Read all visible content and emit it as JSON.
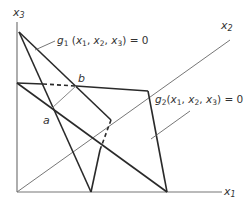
{
  "diagram": {
    "type": "3d-constraint-surfaces",
    "axes": {
      "x1": {
        "label_base": "x",
        "label_sub": "1"
      },
      "x2": {
        "label_base": "x",
        "label_sub": "2"
      },
      "x3": {
        "label_base": "x",
        "label_sub": "3"
      }
    },
    "points": {
      "a": {
        "label": "a"
      },
      "b": {
        "label": "b"
      }
    },
    "surfaces": [
      {
        "name": "g1",
        "label_fn": "g",
        "label_sub": "1",
        "label_args": "(x",
        "eq": "= 0"
      },
      {
        "name": "g2",
        "label_fn": "g",
        "label_sub": "2",
        "label_args": "(x",
        "eq": "= 0"
      }
    ],
    "colors": {
      "heavy_line": "#2a2a2a",
      "axis_line": "#777777",
      "thin_line": "#888888"
    }
  }
}
